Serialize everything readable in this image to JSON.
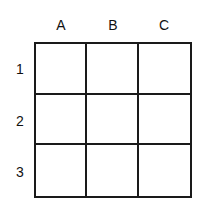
{
  "grid": {
    "columns": [
      "A",
      "B",
      "C"
    ],
    "rows": [
      "1",
      "2",
      "3"
    ],
    "cells": [
      [
        "",
        "",
        ""
      ],
      [
        "",
        "",
        ""
      ],
      [
        "",
        "",
        ""
      ]
    ],
    "line_color": "#1a1a1a",
    "background": "#ffffff"
  }
}
